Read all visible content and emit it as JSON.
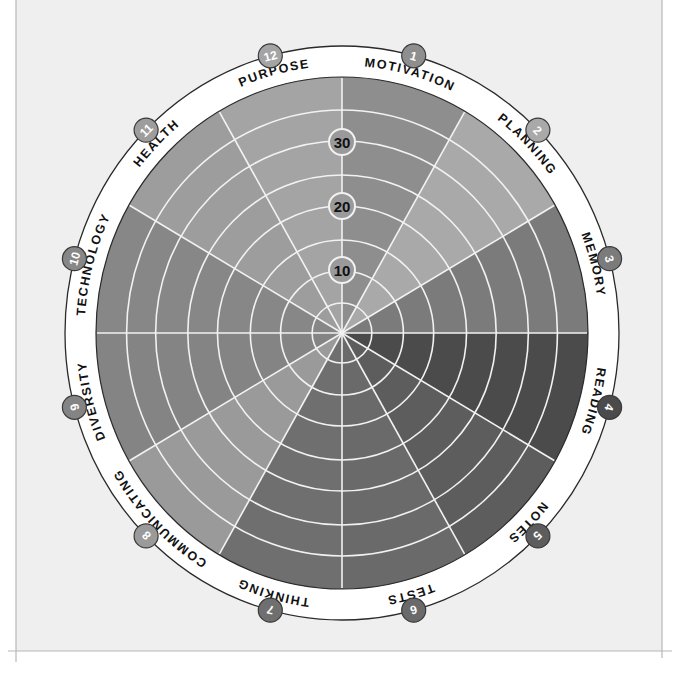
{
  "chart_data": {
    "type": "polar-area",
    "title": "",
    "center": [
      342,
      333
    ],
    "disk_radius": [
      246,
      256
    ],
    "ring_outer_radius": [
      277,
      287
    ],
    "ring_radii": [
      30,
      62,
      93,
      127,
      158,
      192,
      223
    ],
    "scale_labels": [
      {
        "value": "10",
        "radius": 63
      },
      {
        "value": "20",
        "radius": 127
      },
      {
        "value": "30",
        "radius": 191
      }
    ],
    "scale_max": 40,
    "grid": true,
    "categories": [
      {
        "number": "1",
        "label": "MOTIVATION",
        "color": "#8e8e8e"
      },
      {
        "number": "2",
        "label": "PLANNING",
        "color": "#a9a9a9"
      },
      {
        "number": "3",
        "label": "MEMORY",
        "color": "#7b7b7b"
      },
      {
        "number": "4",
        "label": "READING",
        "color": "#4b4b4b"
      },
      {
        "number": "5",
        "label": "NOTES",
        "color": "#5d5d5d"
      },
      {
        "number": "6",
        "label": "TESTS",
        "color": "#6a6a6a"
      },
      {
        "number": "7",
        "label": "THINKING",
        "color": "#6f6f6f"
      },
      {
        "number": "8",
        "label": "COMMUNICATING",
        "color": "#9a9a9a"
      },
      {
        "number": "9",
        "label": "DIVERSITY",
        "color": "#848484"
      },
      {
        "number": "10",
        "label": "TECHNOLOGY",
        "color": "#878787"
      },
      {
        "number": "11",
        "label": "HEALTH",
        "color": "#9d9d9d"
      },
      {
        "number": "12",
        "label": "PURPOSE",
        "color": "#a4a4a4"
      }
    ]
  },
  "frame": {
    "background": "#efefef",
    "line_color": "#b8b8b8"
  }
}
